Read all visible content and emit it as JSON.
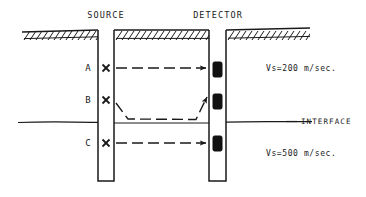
{
  "figure": {
    "title_source": "SOURCE",
    "title_detector": "DETECTOR",
    "interface_label": "INTERFACE",
    "upper_velocity": "Vs=200 m/sec.",
    "lower_velocity": "Vs=500 m/sec.",
    "stations": [
      {
        "id": "A",
        "label": "A",
        "marker": "X"
      },
      {
        "id": "B",
        "label": "B",
        "marker": "X"
      },
      {
        "id": "C",
        "label": "C",
        "marker": "X"
      }
    ],
    "colors": {
      "ink": "#1a1a1a",
      "background": "#ffffff",
      "detector_fill": "#111111"
    }
  }
}
